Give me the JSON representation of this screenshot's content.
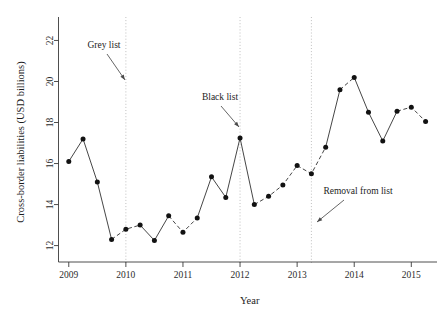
{
  "chart_data": {
    "type": "line",
    "title": "",
    "xlabel": "Year",
    "ylabel": "Cross-border liabilities (USD billions)",
    "xlim": [
      2008.82,
      2015.45
    ],
    "ylim": [
      11.2,
      22.9
    ],
    "grid": false,
    "legend": "none",
    "x_ticks": [
      "2009",
      "2010",
      "2011",
      "2012",
      "2013",
      "2014",
      "2015"
    ],
    "x_tick_values": [
      2009,
      2010,
      2011,
      2012,
      2013,
      2014,
      2015
    ],
    "y_ticks": [
      "12",
      "14",
      "16",
      "18",
      "20",
      "22"
    ],
    "y_tick_values": [
      12,
      14,
      16,
      18,
      20,
      22
    ],
    "x": [
      2009.0,
      2009.25,
      2009.5,
      2009.75,
      2010.0,
      2010.25,
      2010.5,
      2010.75,
      2011.0,
      2011.25,
      2011.5,
      2011.75,
      2012.0,
      2012.25,
      2012.5,
      2012.75,
      2013.0,
      2013.25,
      2013.5,
      2013.75,
      2014.0,
      2014.25,
      2014.5,
      2014.75,
      2015.0,
      2015.25
    ],
    "values": [
      16.1,
      17.2,
      15.1,
      12.3,
      12.8,
      13.0,
      12.25,
      13.45,
      12.65,
      13.35,
      15.35,
      14.35,
      17.25,
      14.0,
      14.4,
      14.95,
      15.9,
      15.5,
      16.8,
      19.6,
      20.2,
      18.5,
      17.1,
      18.55,
      18.75,
      18.05
    ],
    "marker": "filled-circle",
    "line_segments": [
      {
        "name": "solid-2009-2010",
        "style": "solid",
        "from": 2009.0,
        "to": 2009.75
      },
      {
        "name": "dashed-2010",
        "style": "dashed",
        "from": 2009.75,
        "to": 2010.25
      },
      {
        "name": "solid-2010-mid",
        "style": "solid",
        "from": 2010.25,
        "to": 2010.75
      },
      {
        "name": "dashed-2011",
        "style": "dashed",
        "from": 2010.75,
        "to": 2011.25
      },
      {
        "name": "solid-2011-2012",
        "style": "solid",
        "from": 2011.25,
        "to": 2012.25
      },
      {
        "name": "dashed-2012-2013",
        "style": "dashed",
        "from": 2012.25,
        "to": 2013.0
      },
      {
        "name": "dashed-2013",
        "style": "dashed",
        "from": 2013.0,
        "to": 2013.5
      },
      {
        "name": "solid-2013-2014",
        "style": "solid",
        "from": 2013.5,
        "to": 2013.75
      },
      {
        "name": "dashed-2014-peak",
        "style": "dashed",
        "from": 2013.75,
        "to": 2014.0
      },
      {
        "name": "solid-2014-dip",
        "style": "solid",
        "from": 2014.0,
        "to": 2014.75
      },
      {
        "name": "dashed-2015",
        "style": "dashed",
        "from": 2014.75,
        "to": 2015.25
      }
    ],
    "vertical_markers": [
      {
        "name": "grey-list",
        "x": 2010.0
      },
      {
        "name": "black-list",
        "x": 2012.0
      },
      {
        "name": "removal-from-list",
        "x": 2013.25
      }
    ],
    "annotations": [
      {
        "name": "grey-list",
        "label": "Grey list",
        "target_x": 2010.0,
        "target_y": 20.2
      },
      {
        "name": "black-list",
        "label": "Black list",
        "target_x": 2012.0,
        "target_y": 17.85
      },
      {
        "name": "removal-from-list",
        "label": "Removal from list",
        "target_x": 2013.25,
        "target_y": 13.25
      }
    ],
    "colors": {
      "line": "#3c3c3c",
      "marker": "#121212",
      "axis": "#3a3a3a",
      "dotted_guide": "#b9b9b9",
      "text": "#1c1c1c",
      "background": "#ffffff"
    }
  }
}
